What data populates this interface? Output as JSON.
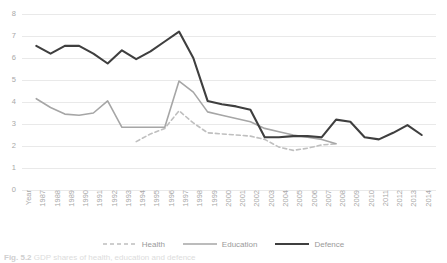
{
  "chart_data": {
    "type": "line",
    "title": "",
    "xlabel": "Year",
    "ylabel": "",
    "ylim": [
      0,
      8
    ],
    "yticks": [
      0,
      1,
      2,
      3,
      4,
      5,
      6,
      7,
      8
    ],
    "grid": true,
    "legend_position": "bottom",
    "categories": [
      "1987",
      "1988",
      "1989",
      "1990",
      "1991",
      "1992",
      "1993",
      "1994",
      "1995",
      "1996",
      "1997",
      "1998",
      "1999",
      "2000",
      "2001",
      "2002",
      "2003",
      "2004",
      "2005",
      "2006",
      "2007",
      "2008",
      "2009",
      "2010",
      "2011",
      "2012",
      "2013",
      "2014"
    ],
    "series": [
      {
        "name": "Health",
        "style": "dashed",
        "color": "#bfbfbf",
        "values": [
          null,
          null,
          null,
          null,
          null,
          null,
          null,
          2.2,
          2.55,
          2.8,
          3.6,
          3.05,
          2.6,
          2.55,
          2.5,
          2.45,
          2.3,
          1.95,
          1.8,
          1.9,
          2.05,
          2.1,
          null,
          null,
          null,
          null,
          null,
          null
        ]
      },
      {
        "name": "Education",
        "style": "solid",
        "color": "#a6a6a6",
        "values": [
          4.15,
          3.75,
          3.45,
          3.4,
          3.5,
          4.05,
          2.85,
          2.85,
          2.85,
          2.85,
          4.95,
          4.45,
          3.55,
          3.4,
          3.25,
          3.1,
          2.8,
          2.65,
          2.5,
          2.4,
          2.3,
          2.1,
          null,
          null,
          null,
          null,
          null,
          null
        ]
      },
      {
        "name": "Defence",
        "style": "solid",
        "color": "#3f3f3f",
        "values": [
          6.55,
          6.2,
          6.55,
          6.55,
          6.2,
          5.75,
          6.35,
          5.95,
          6.3,
          6.75,
          7.2,
          6.0,
          4.05,
          3.9,
          3.8,
          3.65,
          2.4,
          2.4,
          2.45,
          2.45,
          2.4,
          3.2,
          3.1,
          2.4,
          2.3,
          2.6,
          2.95,
          2.5
        ]
      }
    ]
  },
  "axis": {
    "x_axis_title": "Year"
  },
  "legend": {
    "items": [
      {
        "label": "Health"
      },
      {
        "label": "Education"
      },
      {
        "label": "Defence"
      }
    ]
  },
  "caption": {
    "number": "Fig. 5.2",
    "text": "GDP shares of health, education and defence"
  }
}
